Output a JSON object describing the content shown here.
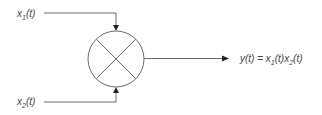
{
  "diagram": {
    "type": "signal-multiplier-block",
    "inputs": [
      {
        "id": "x1",
        "base": "x",
        "sub": "1",
        "arg": "(t)"
      },
      {
        "id": "x2",
        "base": "x",
        "sub": "2",
        "arg": "(t)"
      }
    ],
    "block": {
      "symbol": "multiplier",
      "glyph": "×"
    },
    "output": {
      "lhs": "y(t) = ",
      "term1_base": "x",
      "term1_sub": "1",
      "term1_arg": "(t)",
      "term2_base": "x",
      "term2_sub": "2",
      "term2_arg": "(t)"
    },
    "colors": {
      "line": "#6b6b6b",
      "arrow": "#222222",
      "text": "#444444",
      "background": "#ffffff"
    }
  }
}
